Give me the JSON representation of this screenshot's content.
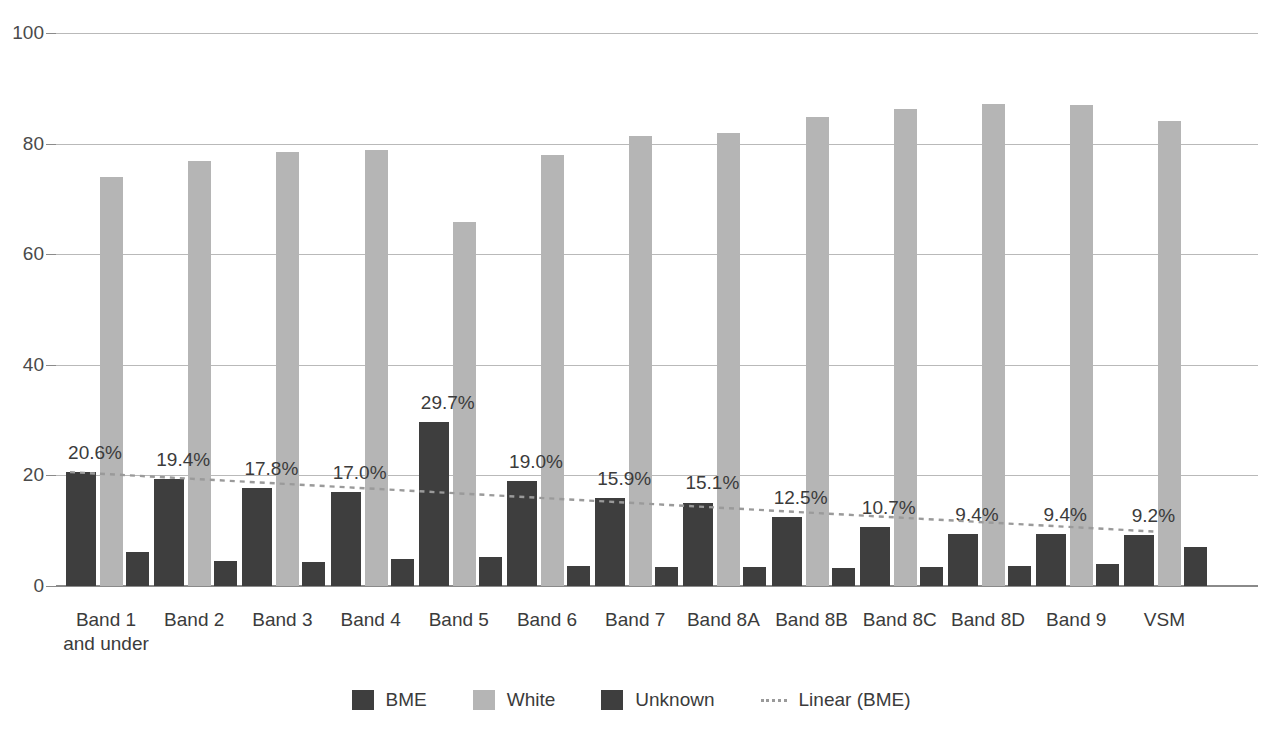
{
  "chart_data": {
    "type": "bar",
    "title": "",
    "subtitle": "",
    "xlabel": "",
    "ylabel": "",
    "ylim": [
      0,
      100
    ],
    "yticks": [
      0,
      20,
      40,
      60,
      80,
      100
    ],
    "ytick_labels": [
      "0",
      "20",
      "40",
      "60",
      "80",
      "100"
    ],
    "grid": true,
    "legend_position": "bottom",
    "categories": [
      "Band 1 and under",
      "Band 2",
      "Band 3",
      "Band 4",
      "Band 5",
      "Band 6",
      "Band 7",
      "Band 8A",
      "Band 8B",
      "Band 8C",
      "Band 8D",
      "Band 9",
      "VSM"
    ],
    "category_lines": [
      [
        "Band 1",
        "and under"
      ],
      [
        "Band 2"
      ],
      [
        "Band 3"
      ],
      [
        "Band 4"
      ],
      [
        "Band 5"
      ],
      [
        "Band 6"
      ],
      [
        "Band 7"
      ],
      [
        "Band 8A"
      ],
      [
        "Band 8B"
      ],
      [
        "Band 8C"
      ],
      [
        "Band 8D"
      ],
      [
        "Band 9"
      ],
      [
        "VSM"
      ]
    ],
    "series": [
      {
        "name": "BME",
        "color": "#3e3e3e",
        "values": [
          20.6,
          19.4,
          17.8,
          17.0,
          29.7,
          19.0,
          15.9,
          15.1,
          12.5,
          10.7,
          9.4,
          9.4,
          9.2
        ],
        "labels": [
          "20.6%",
          "19.4%",
          "17.8%",
          "17.0%",
          "29.7%",
          "19.0%",
          "15.9%",
          "15.1%",
          "12.5%",
          "10.7%",
          "9.4%",
          "9.4%",
          "9.2%"
        ]
      },
      {
        "name": "White",
        "color": "#b5b5b5",
        "values": [
          74.0,
          76.8,
          78.5,
          78.9,
          65.8,
          77.9,
          81.3,
          82.0,
          84.9,
          86.2,
          87.1,
          87.0,
          84.1
        ],
        "labels": []
      },
      {
        "name": "Unknown",
        "color": "#3e3e3e",
        "values": [
          6.2,
          4.6,
          4.3,
          4.8,
          5.2,
          3.7,
          3.5,
          3.4,
          3.2,
          3.5,
          3.7,
          4.0,
          7.0
        ],
        "labels": []
      }
    ],
    "trendline": {
      "name": "Linear (BME)",
      "style": "dotted",
      "color": "#9a9a9a",
      "start_value": 20.6,
      "end_value": 9.8
    },
    "legend": [
      {
        "label": "BME",
        "color": "#3e3e3e",
        "marker": "square"
      },
      {
        "label": "White",
        "color": "#b5b5b5",
        "marker": "square"
      },
      {
        "label": "Unknown",
        "color": "#3e3e3e",
        "marker": "square"
      },
      {
        "label": "Linear (BME)",
        "color": "#9a9a9a",
        "marker": "dotted-line"
      }
    ]
  }
}
